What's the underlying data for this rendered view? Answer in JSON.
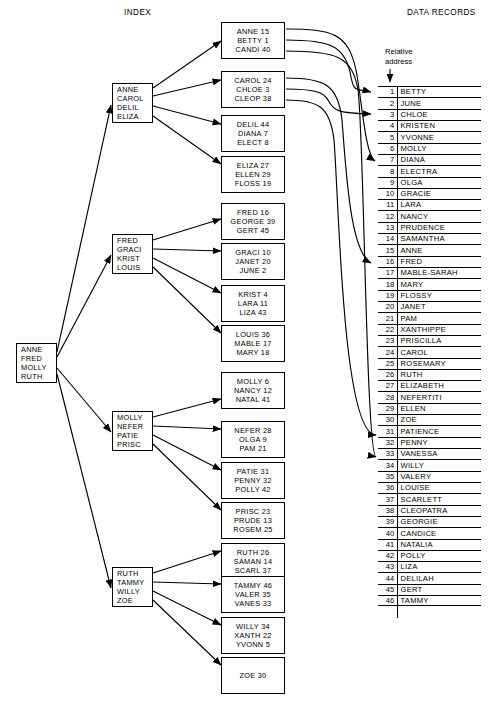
{
  "headers": {
    "index": "INDEX",
    "data_records": "DATA RECORDS",
    "relative_address_line1": "Relative",
    "relative_address_line2": "address"
  },
  "diagram": {
    "type": "b-tree-index-to-data-records",
    "root": {
      "name": "root-node",
      "keys": [
        "ANNE",
        "FRED",
        "MOLLY",
        "RUTH"
      ]
    },
    "intermediate_nodes": [
      {
        "name": "intermediate-node-anne",
        "keys": [
          "ANNE",
          "CAROL",
          "DELIL",
          "ELIZA"
        ]
      },
      {
        "name": "intermediate-node-fred",
        "keys": [
          "FRED",
          "GRACI",
          "KRIST",
          "LOUIS"
        ]
      },
      {
        "name": "intermediate-node-molly",
        "keys": [
          "MOLLY",
          "NEFER",
          "PATIE",
          "PRISC"
        ]
      },
      {
        "name": "intermediate-node-ruth",
        "keys": [
          "RUTH",
          "TAMMY",
          "WILLY",
          "ZOE"
        ]
      }
    ],
    "leaf_nodes": [
      {
        "name": "leaf-anne",
        "entries": [
          "ANNE 15",
          "BETTY 1",
          "CANDI 40"
        ]
      },
      {
        "name": "leaf-carol",
        "entries": [
          "CAROL 24",
          "CHLOE 3",
          "CLEOP 38"
        ]
      },
      {
        "name": "leaf-delil",
        "entries": [
          "DELIL 44",
          "DIANA 7",
          "ELECT 8"
        ]
      },
      {
        "name": "leaf-eliza",
        "entries": [
          "ELIZA 27",
          "ELLEN 29",
          "FLOSS 19"
        ]
      },
      {
        "name": "leaf-fred",
        "entries": [
          "FRED 16",
          "GEORGE 39",
          "GERT 45"
        ]
      },
      {
        "name": "leaf-graci",
        "entries": [
          "GRACI 10",
          "JANET 20",
          "JUNE 2"
        ]
      },
      {
        "name": "leaf-krist",
        "entries": [
          "KRIST 4",
          "LARA 11",
          "LIZA 43"
        ]
      },
      {
        "name": "leaf-louis",
        "entries": [
          "LOUIS 36",
          "MABLE 17",
          "MARY 18"
        ]
      },
      {
        "name": "leaf-molly",
        "entries": [
          "MOLLY 6",
          "NANCY 12",
          "NATAL 41"
        ]
      },
      {
        "name": "leaf-nefer",
        "entries": [
          "NEFER 28",
          "OLGA 9",
          "PAM 21"
        ]
      },
      {
        "name": "leaf-patie",
        "entries": [
          "PATIE 31",
          "PENNY 32",
          "POLLY 42"
        ]
      },
      {
        "name": "leaf-prisc",
        "entries": [
          "PRISC 23",
          "PRUDE 13",
          "ROSEM 25"
        ]
      },
      {
        "name": "leaf-ruth",
        "entries": [
          "RUTH 26",
          "SAMAN 14",
          "SCARL 37"
        ]
      },
      {
        "name": "leaf-tammy",
        "entries": [
          "TAMMY 46",
          "VALER 35",
          "VANES 33"
        ]
      },
      {
        "name": "leaf-willy",
        "entries": [
          "WILLY 34",
          "XANTH 22",
          "YVONN 5"
        ]
      },
      {
        "name": "leaf-zoe",
        "entries": [
          "ZOE 30"
        ]
      }
    ],
    "data_records": [
      {
        "address": "1",
        "name": "BETTY"
      },
      {
        "address": "2",
        "name": "JUNE"
      },
      {
        "address": "3",
        "name": "CHLOE"
      },
      {
        "address": "4",
        "name": "KRISTEN"
      },
      {
        "address": "5",
        "name": "YVONNE"
      },
      {
        "address": "6",
        "name": "MOLLY"
      },
      {
        "address": "7",
        "name": "DIANA"
      },
      {
        "address": "8",
        "name": "ELECTRA"
      },
      {
        "address": "9",
        "name": "OLGA"
      },
      {
        "address": "10",
        "name": "GRACIE"
      },
      {
        "address": "11",
        "name": "LARA"
      },
      {
        "address": "12",
        "name": "NANCY"
      },
      {
        "address": "13",
        "name": "PRUDENCE"
      },
      {
        "address": "14",
        "name": "SAMANTHA"
      },
      {
        "address": "15",
        "name": "ANNE"
      },
      {
        "address": "16",
        "name": "FRED"
      },
      {
        "address": "17",
        "name": "MABLE-SARAH"
      },
      {
        "address": "18",
        "name": "MARY"
      },
      {
        "address": "19",
        "name": "FLOSSY"
      },
      {
        "address": "20",
        "name": "JANET"
      },
      {
        "address": "21",
        "name": "PAM"
      },
      {
        "address": "22",
        "name": "XANTHIPPE"
      },
      {
        "address": "23",
        "name": "PRISCILLA"
      },
      {
        "address": "24",
        "name": "CAROL"
      },
      {
        "address": "25",
        "name": "ROSEMARY"
      },
      {
        "address": "26",
        "name": "RUTH"
      },
      {
        "address": "27",
        "name": "ELIZABETH"
      },
      {
        "address": "28",
        "name": "NEFERTITI"
      },
      {
        "address": "29",
        "name": "ELLEN"
      },
      {
        "address": "30",
        "name": "ZOE"
      },
      {
        "address": "31",
        "name": "PATIENCE"
      },
      {
        "address": "32",
        "name": "PENNY"
      },
      {
        "address": "33",
        "name": "VANESSA"
      },
      {
        "address": "34",
        "name": "WILLY"
      },
      {
        "address": "35",
        "name": "VALERY"
      },
      {
        "address": "36",
        "name": "LOUISE"
      },
      {
        "address": "37",
        "name": "SCARLETT"
      },
      {
        "address": "38",
        "name": "CLEOPATRA"
      },
      {
        "address": "39",
        "name": "GEORGIE"
      },
      {
        "address": "40",
        "name": "CANDICE"
      },
      {
        "address": "41",
        "name": "NATALIA"
      },
      {
        "address": "42",
        "name": "POLLY"
      },
      {
        "address": "43",
        "name": "LIZA"
      },
      {
        "address": "44",
        "name": "DELILAH"
      },
      {
        "address": "45",
        "name": "GERT"
      },
      {
        "address": "46",
        "name": "TAMMY"
      }
    ]
  },
  "colors": {
    "ink": "#000000",
    "paper": "#ffffff"
  }
}
